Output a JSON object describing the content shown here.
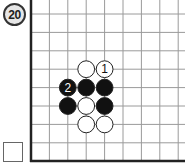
{
  "problem": {
    "number_label": "20"
  },
  "board": {
    "origin_x": 31,
    "origin_y": 14,
    "spacing": 18.4,
    "cols": 9,
    "rows": 9,
    "line_color": "#9a9a9a",
    "edge_color": "#222222",
    "edges": [
      "left",
      "bottom"
    ],
    "stones": [
      {
        "col": 3,
        "row": 3,
        "color": "white",
        "label": ""
      },
      {
        "col": 4,
        "row": 3,
        "color": "white",
        "label": "1"
      },
      {
        "col": 2,
        "row": 4,
        "color": "black",
        "label": "2"
      },
      {
        "col": 3,
        "row": 4,
        "color": "black",
        "label": ""
      },
      {
        "col": 4,
        "row": 4,
        "color": "black",
        "label": ""
      },
      {
        "col": 2,
        "row": 5,
        "color": "black",
        "label": ""
      },
      {
        "col": 3,
        "row": 5,
        "color": "white",
        "label": ""
      },
      {
        "col": 4,
        "row": 5,
        "color": "black",
        "label": ""
      },
      {
        "col": 3,
        "row": 6,
        "color": "white",
        "label": ""
      },
      {
        "col": 4,
        "row": 6,
        "color": "white",
        "label": ""
      }
    ]
  },
  "answer_checkbox": {
    "checked": false
  }
}
